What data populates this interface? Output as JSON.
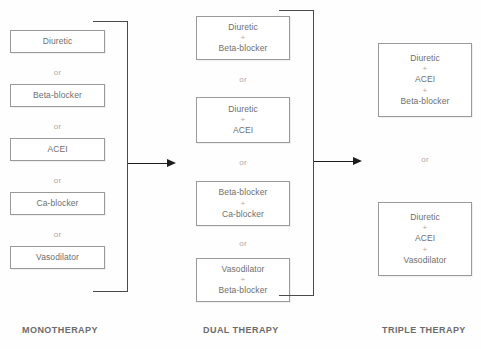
{
  "diagram": {
    "columns": [
      {
        "id": "monotherapy",
        "caption": "MONOTHERAPY",
        "separator": "or",
        "options": [
          {
            "lines": [
              "Diuretic"
            ]
          },
          {
            "lines": [
              "Beta-blocker"
            ]
          },
          {
            "lines": [
              "ACEI"
            ]
          },
          {
            "lines": [
              "Ca-blocker"
            ]
          },
          {
            "lines": [
              "Vasodilator"
            ]
          }
        ]
      },
      {
        "id": "dual-therapy",
        "caption": "DUAL THERAPY",
        "separator": "or",
        "options": [
          {
            "lines": [
              "Diuretic",
              "Beta-blocker"
            ]
          },
          {
            "lines": [
              "Diuretic",
              "ACEI"
            ]
          },
          {
            "lines": [
              "Beta-blocker",
              "Ca-blocker"
            ]
          },
          {
            "lines": [
              "Vasodilator",
              "Beta-blocker"
            ]
          }
        ]
      },
      {
        "id": "triple-therapy",
        "caption": "TRIPLE THERAPY",
        "separator": "or",
        "options": [
          {
            "lines": [
              "Diuretic",
              "ACEI",
              "Beta-blocker"
            ]
          },
          {
            "lines": [
              "Diuretic",
              "ACEI",
              "Vasodilator"
            ]
          }
        ]
      }
    ],
    "connector_symbol": "+",
    "arrows": [
      {
        "from": "monotherapy",
        "to": "dual-therapy"
      },
      {
        "from": "dual-therapy",
        "to": "triple-therapy"
      }
    ],
    "colors": {
      "background": "#fefefe",
      "box_border": "#9a9a9a",
      "box_fill": "#ffffff",
      "text": "#6e6e6e",
      "separator_text": "#a9a9a9",
      "caption_text": "#6b6b6b",
      "bracket_line": "#4a4a4a",
      "arrow": "#1d1d1d"
    }
  }
}
